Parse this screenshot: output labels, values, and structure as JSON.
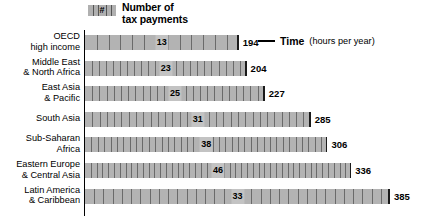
{
  "legend": {
    "swatch_symbol": "#",
    "swatch_icon": "tick-bar-icon",
    "label": "Number of\ntax payments"
  },
  "annotation": {
    "leader_icon": "leader-line-icon",
    "bold_text": "Time",
    "regular_text": "(hours per year)"
  },
  "chart_data": {
    "type": "bar",
    "title": "",
    "subtitle": "",
    "xlabel": "",
    "ylabel": "",
    "orientation": "horizontal",
    "grid": false,
    "legend_position": "top-left",
    "xlim": [
      0,
      385
    ],
    "categories": [
      "OECD\nhigh income",
      "Middle East\n& North Africa",
      "East Asia\n& Pacific",
      "South Asia",
      "Sub-Saharan\nAfrica",
      "Eastern Europe\n& Central Asia",
      "Latin America\n& Caribbean"
    ],
    "series": [
      {
        "name": "Time (hours per year)",
        "unit": "hours per year",
        "values": [
          194,
          204,
          227,
          285,
          306,
          336,
          385
        ]
      },
      {
        "name": "Number of tax payments",
        "unit": "payments",
        "values": [
          13,
          23,
          25,
          31,
          38,
          46,
          33
        ]
      }
    ],
    "annotations": [
      {
        "row": 0,
        "text": "Time (hours per year)"
      }
    ]
  }
}
